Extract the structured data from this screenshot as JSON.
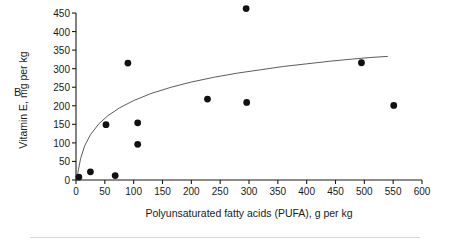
{
  "figure": {
    "panel_label": "B",
    "background_color": "#ffffff",
    "axis_color": "#1a1a1a",
    "point_color": "#111111",
    "curve_color": "#4a4a4a",
    "rule_color": "#d8d8d8"
  },
  "chart_data": {
    "type": "scatter",
    "title": "",
    "subtitle": "",
    "panel": "B",
    "xlabel": "Polyunsaturated fatty acids (PUFA), g per kg",
    "ylabel": "Vitamin E, mg per kg",
    "xlim": [
      0,
      600
    ],
    "ylim": [
      0,
      450
    ],
    "xticks": [
      0,
      50,
      100,
      150,
      200,
      250,
      300,
      350,
      400,
      450,
      500,
      550,
      600
    ],
    "yticks": [
      0,
      50,
      100,
      150,
      200,
      250,
      300,
      350,
      400,
      450
    ],
    "xtick_labels": [
      "0",
      "50",
      "100",
      "150",
      "200",
      "250",
      "300",
      "350",
      "400",
      "450",
      "500",
      "550",
      "600"
    ],
    "ytick_labels": [
      "0",
      "50",
      "100",
      "150",
      "200",
      "250",
      "300",
      "350",
      "400",
      "450"
    ],
    "grid": false,
    "legend": null,
    "legend_position": "none",
    "points": [
      {
        "x": 5,
        "y": 8
      },
      {
        "x": 25,
        "y": 22
      },
      {
        "x": 52,
        "y": 149
      },
      {
        "x": 68,
        "y": 12
      },
      {
        "x": 90,
        "y": 315
      },
      {
        "x": 107,
        "y": 154
      },
      {
        "x": 107,
        "y": 96
      },
      {
        "x": 228,
        "y": 218
      },
      {
        "x": 295,
        "y": 462
      },
      {
        "x": 296,
        "y": 209
      },
      {
        "x": 495,
        "y": 316
      },
      {
        "x": 551,
        "y": 201
      }
    ],
    "fit_curve": {
      "kind": "logarithmic",
      "label": "",
      "x_range": [
        3,
        540
      ],
      "points": [
        {
          "x": 3,
          "y": 18
        },
        {
          "x": 8,
          "y": 58
        },
        {
          "x": 15,
          "y": 92
        },
        {
          "x": 25,
          "y": 122
        },
        {
          "x": 40,
          "y": 152
        },
        {
          "x": 55,
          "y": 173
        },
        {
          "x": 75,
          "y": 194
        },
        {
          "x": 100,
          "y": 214
        },
        {
          "x": 130,
          "y": 233
        },
        {
          "x": 165,
          "y": 250
        },
        {
          "x": 200,
          "y": 264
        },
        {
          "x": 240,
          "y": 277
        },
        {
          "x": 280,
          "y": 288
        },
        {
          "x": 320,
          "y": 297
        },
        {
          "x": 360,
          "y": 306
        },
        {
          "x": 400,
          "y": 313
        },
        {
          "x": 440,
          "y": 320
        },
        {
          "x": 480,
          "y": 326
        },
        {
          "x": 510,
          "y": 330
        },
        {
          "x": 540,
          "y": 333
        }
      ]
    }
  }
}
